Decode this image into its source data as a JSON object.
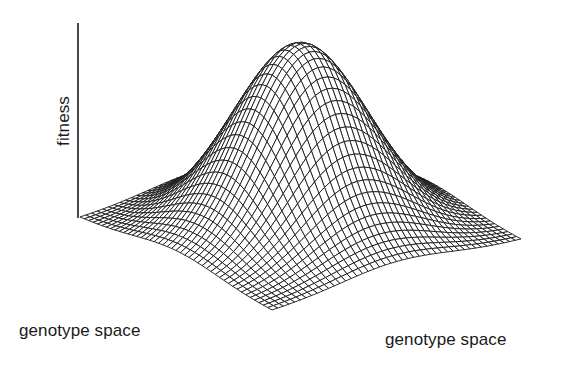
{
  "figure": {
    "type": "3d-wireframe-surface",
    "line_color": "#1a1a1a",
    "background": "#ffffff"
  },
  "labels": {
    "fitness_axis": "fitness",
    "genotype_axis_left": "genotype space",
    "genotype_axis_right": "genotype space"
  },
  "surface": {
    "function": "gaussian",
    "grid_lines_per_axis": 44,
    "sigma": 0.22,
    "peak_height_px": 185,
    "base_corners_px": {
      "left": [
        80,
        218
      ],
      "front": [
        272,
        311
      ],
      "right": [
        521,
        240
      ],
      "back": [
        329,
        147
      ]
    }
  },
  "fitness_axis_line": {
    "x": 78,
    "y_top": 23,
    "y_bottom": 218
  }
}
